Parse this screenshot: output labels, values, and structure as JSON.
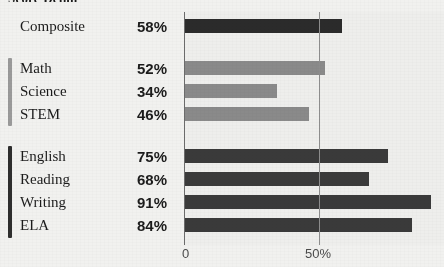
{
  "title": "Score Detail",
  "colors": {
    "page_background": "#f1f1ef",
    "plot_background": "#eeeeec",
    "axis": "#6c6c6c",
    "gridline": "#8d8d8d",
    "composite_bar": "#2b2b2b",
    "stem_bar": "#8a8a8a",
    "ela_bar": "#3a3a3a",
    "bracket_light": "#9a9a9a",
    "bracket_dark": "#2e2e2e",
    "text": "#1b1b1b",
    "tick_text": "#4b4b4b"
  },
  "rows": [
    {
      "label": "Composite",
      "value": "58%",
      "pct": 58,
      "group": "composite"
    },
    {
      "label": "Math",
      "value": "52%",
      "pct": 52,
      "group": "stem"
    },
    {
      "label": "Science",
      "value": "34%",
      "pct": 34,
      "group": "stem"
    },
    {
      "label": "STEM",
      "value": "46%",
      "pct": 46,
      "group": "stem"
    },
    {
      "label": "English",
      "value": "75%",
      "pct": 75,
      "group": "ela"
    },
    {
      "label": "Reading",
      "value": "68%",
      "pct": 68,
      "group": "ela"
    },
    {
      "label": "Writing",
      "value": "91%",
      "pct": 91,
      "group": "ela"
    },
    {
      "label": "ELA",
      "value": "84%",
      "pct": 84,
      "group": "ela"
    }
  ],
  "axis": {
    "ticks": [
      {
        "label": "0",
        "pct": 0
      },
      {
        "label": "50%",
        "pct": 50
      },
      {
        "label": "10",
        "pct": 100
      }
    ],
    "gridlines": [
      50
    ]
  },
  "chart_data": {
    "type": "bar",
    "orientation": "horizontal",
    "title": "Score Detail",
    "xlabel": "",
    "ylabel": "",
    "xlim": [
      0,
      100
    ],
    "grid": true,
    "legend": "none",
    "categories": [
      "Composite",
      "Math",
      "Science",
      "STEM",
      "English",
      "Reading",
      "Writing",
      "ELA"
    ],
    "values": [
      58,
      52,
      34,
      46,
      75,
      68,
      91,
      84
    ],
    "value_labels": [
      "58%",
      "52%",
      "34%",
      "46%",
      "75%",
      "68%",
      "91%",
      "84%"
    ],
    "tick_labels": [
      "0",
      "50%",
      "10"
    ],
    "groups": [
      {
        "name": "Composite",
        "members": [
          "Composite"
        ]
      },
      {
        "name": "STEM",
        "members": [
          "Math",
          "Science",
          "STEM"
        ]
      },
      {
        "name": "ELA",
        "members": [
          "English",
          "Reading",
          "Writing",
          "ELA"
        ]
      }
    ]
  }
}
